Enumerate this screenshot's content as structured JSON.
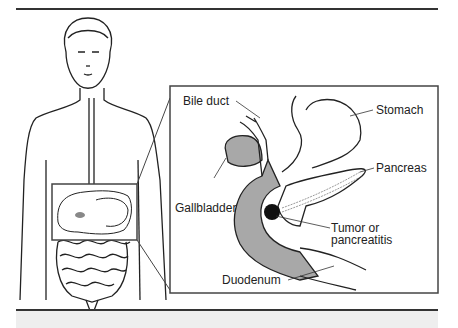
{
  "figure": {
    "type": "anatomical illustration",
    "labels": {
      "bile_duct": "Bile duct",
      "stomach": "Stomach",
      "pancreas": "Pancreas",
      "gallbladder": "Gallbladder",
      "tumor_line1": "Tumor or",
      "tumor_line2": "pancreatitis",
      "duodenum": "Duodenum"
    },
    "colors": {
      "line": "#222222",
      "shade": "#a8a8a8",
      "tumor": "#111111",
      "background": "#ffffff",
      "band": "#eeeeee"
    }
  }
}
